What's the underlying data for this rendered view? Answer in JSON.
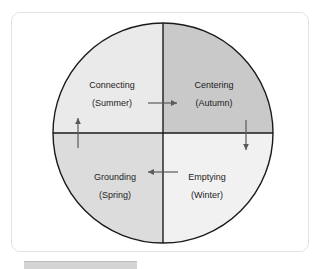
{
  "figure": {
    "name": "four-quadrant-seasonal-cycle-diagram",
    "shape": "circle-divided-in-four-quadrants",
    "center": {
      "x": 163,
      "y": 133
    },
    "radius": 110,
    "outline_color": "#1a1a1a",
    "frame_color": "#e2e2e2",
    "background_color": "#ffffff"
  },
  "quadrants": [
    {
      "id": "upper-left",
      "title": "Connecting",
      "season": "(Summer)",
      "fill": "#eaeaea",
      "label_x": 112,
      "title_y": 88,
      "season_y": 106
    },
    {
      "id": "upper-right",
      "title": "Centering",
      "season": "(Autumn)",
      "fill": "#c9c9c9",
      "label_x": 214,
      "title_y": 88,
      "season_y": 106
    },
    {
      "id": "lower-left",
      "title": "Grounding",
      "season": "(Spring)",
      "fill": "#dcdcdc",
      "label_x": 115,
      "title_y": 180,
      "season_y": 198
    },
    {
      "id": "lower-right",
      "title": "Emptying",
      "season": "(Winter)",
      "fill": "#f1f1f1",
      "label_x": 207,
      "title_y": 180,
      "season_y": 198
    }
  ],
  "arrows": [
    {
      "id": "top-right-arrow",
      "direction": "right",
      "color": "#5a5a5a"
    },
    {
      "id": "right-down-arrow",
      "direction": "down",
      "color": "#5a5a5a"
    },
    {
      "id": "bottom-left-arrow",
      "direction": "left",
      "color": "#5a5a5a"
    },
    {
      "id": "left-up-arrow",
      "direction": "up",
      "color": "#5a5a5a"
    }
  ],
  "bottom_strip": {
    "id": "cropped-caption-strip",
    "color": "#d4d4d4"
  }
}
